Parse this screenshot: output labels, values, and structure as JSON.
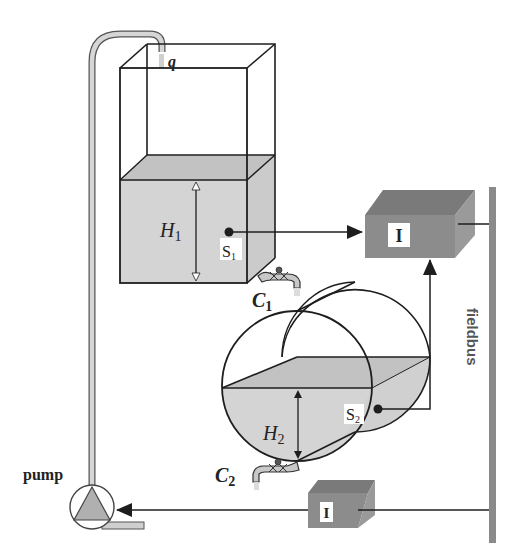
{
  "diagram": {
    "type": "process-control-schematic",
    "labels": {
      "inflow": "q",
      "tank1_level": "H",
      "tank1_level_sub": "1",
      "sensor1": "S",
      "sensor1_sub": "1",
      "valve1": "C",
      "valve1_sub": "1",
      "tank2_level": "H",
      "tank2_level_sub": "2",
      "sensor2": "S",
      "sensor2_sub": "2",
      "valve2": "C",
      "valve2_sub": "2",
      "controller_upper": "I",
      "controller_lower": "I",
      "bus": "fieldbus",
      "pump": "pump"
    },
    "components": [
      {
        "id": "tank1",
        "kind": "rectangular-tank",
        "label": "H1"
      },
      {
        "id": "tank2",
        "kind": "cylindrical-tank",
        "label": "H2"
      },
      {
        "id": "sensor1",
        "kind": "level-sensor",
        "label": "S1"
      },
      {
        "id": "sensor2",
        "kind": "level-sensor",
        "label": "S2"
      },
      {
        "id": "valve1",
        "kind": "outlet-valve",
        "label": "C1"
      },
      {
        "id": "valve2",
        "kind": "outlet-valve",
        "label": "C2"
      },
      {
        "id": "ctrl1",
        "kind": "fieldbus-device",
        "label": "I"
      },
      {
        "id": "ctrl2",
        "kind": "fieldbus-device",
        "label": "I"
      },
      {
        "id": "fieldbus",
        "kind": "bus-line",
        "label": "fieldbus"
      },
      {
        "id": "pump",
        "kind": "pump",
        "label": "pump"
      }
    ],
    "connections": [
      {
        "from": "sensor1",
        "to": "ctrl1"
      },
      {
        "from": "sensor2",
        "to": "ctrl1"
      },
      {
        "from": "ctrl1",
        "to": "fieldbus"
      },
      {
        "from": "fieldbus",
        "to": "ctrl2"
      },
      {
        "from": "ctrl2",
        "to": "pump"
      },
      {
        "from": "pump",
        "to": "tank1",
        "via": "pipe",
        "flow": "q"
      }
    ],
    "colors": {
      "liquid": "#d4d4d4",
      "liquid_top": "#bdbdbd",
      "device_front": "#8c8c8c",
      "device_top": "#7a7a7a",
      "device_side": "#9a9a9a",
      "bus": "#8a8a8a",
      "pipe": "#cfcfcf",
      "line": "#1e1e1e"
    }
  }
}
